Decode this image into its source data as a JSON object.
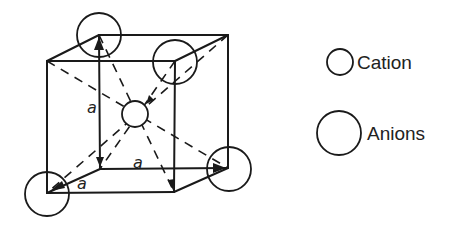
{
  "diagram": {
    "type": "crystal-unit-cell",
    "lattice_labels": [
      "a",
      "a",
      "a"
    ],
    "sites": {
      "corner_anions": 8,
      "body_center_cation": 1
    },
    "legend": [
      {
        "symbol": "small-circle",
        "label": "Cation"
      },
      {
        "symbol": "large-circle",
        "label": "Anions"
      }
    ],
    "colors": {
      "line": "#1a1a1a",
      "background": "#ffffff"
    }
  }
}
